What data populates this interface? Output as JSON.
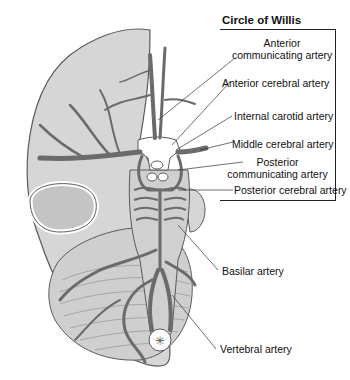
{
  "figure": {
    "title": "Circle of Willis",
    "labels": [
      {
        "id": "anterior-communicating",
        "line1": "Anterior",
        "line2": "communicating artery"
      },
      {
        "id": "anterior-cerebral",
        "text": "Anterior cerebral artery"
      },
      {
        "id": "internal-carotid",
        "text": "Internal carotid artery"
      },
      {
        "id": "middle-cerebral",
        "text": "Middle cerebral artery"
      },
      {
        "id": "posterior-communicating",
        "line1": "Posterior",
        "line2": "communicating artery"
      },
      {
        "id": "posterior-cerebral",
        "text": "Posterior cerebral  artery"
      },
      {
        "id": "basilar",
        "text": "Basilar artery"
      },
      {
        "id": "vertebral",
        "text": "Vertebral artery"
      }
    ],
    "colors": {
      "brain_fill": "#d6d6d6",
      "brain_outline": "#5a5a5a",
      "artery": "#6b6b6b",
      "background": "#ffffff",
      "text": "#111111"
    }
  }
}
